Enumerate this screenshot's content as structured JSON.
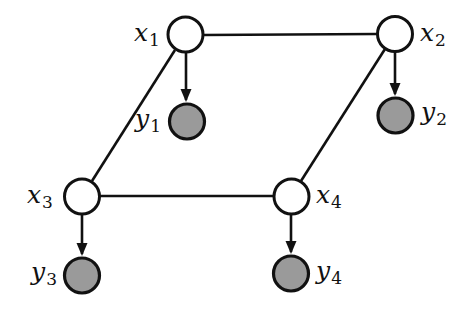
{
  "diagram": {
    "type": "graphical-model",
    "colors": {
      "latent_fill": "#ffffff",
      "observed_fill": "#9a9a9a",
      "stroke": "#111111",
      "background": "#ffffff"
    },
    "nodes": {
      "x1": {
        "var": "x",
        "sub": "1",
        "kind": "latent",
        "cx": 185,
        "cy": 35
      },
      "x2": {
        "var": "x",
        "sub": "2",
        "kind": "latent",
        "cx": 395,
        "cy": 34
      },
      "x3": {
        "var": "x",
        "sub": "3",
        "kind": "latent",
        "cx": 82,
        "cy": 196
      },
      "x4": {
        "var": "x",
        "sub": "4",
        "kind": "latent",
        "cx": 291,
        "cy": 196
      },
      "y1": {
        "var": "y",
        "sub": "1",
        "kind": "observed",
        "cx": 187,
        "cy": 121
      },
      "y2": {
        "var": "y",
        "sub": "2",
        "kind": "observed",
        "cx": 395,
        "cy": 115
      },
      "y3": {
        "var": "y",
        "sub": "3",
        "kind": "observed",
        "cx": 82,
        "cy": 275
      },
      "y4": {
        "var": "y",
        "sub": "4",
        "kind": "observed",
        "cx": 291,
        "cy": 273
      }
    },
    "undirected_edges": [
      [
        "x1",
        "x2"
      ],
      [
        "x1",
        "x3"
      ],
      [
        "x2",
        "x4"
      ],
      [
        "x3",
        "x4"
      ]
    ],
    "directed_edges": [
      [
        "x1",
        "y1"
      ],
      [
        "x2",
        "y2"
      ],
      [
        "x3",
        "y3"
      ],
      [
        "x4",
        "y4"
      ]
    ]
  }
}
